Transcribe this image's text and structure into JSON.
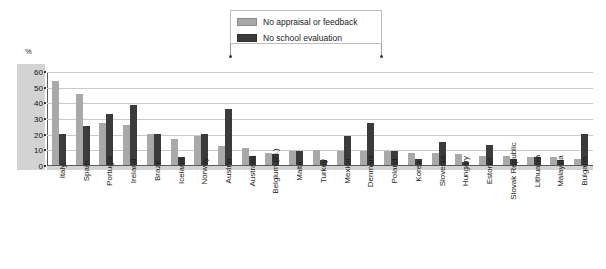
{
  "legend": {
    "items": [
      {
        "label": "No appraisal or feedback",
        "color": "#a9a9a9",
        "swatch_name": "legend-swatch-light"
      },
      {
        "label": "No school evaluation",
        "color": "#3b3b3b",
        "swatch_name": "legend-swatch-dark"
      }
    ]
  },
  "axis": {
    "unit_label": "%",
    "ticks": [
      "60",
      "50",
      "40",
      "30",
      "20",
      "10",
      "0"
    ]
  },
  "chart_data": {
    "type": "bar",
    "title": "",
    "xlabel": "",
    "ylabel": "%",
    "ylim": [
      0,
      60
    ],
    "ytick_step": 10,
    "grid": true,
    "legend_position": "top-center",
    "categories": [
      "Italy",
      "Spain",
      "Portugal",
      "Ireland",
      "Brazil",
      "Iceland",
      "Norway",
      "Austria",
      "Australia",
      "Belgium (Fl.)",
      "Malta",
      "Turkey",
      "Mexico",
      "Denmark",
      "Poland",
      "Korea",
      "Slovenia",
      "Hungary",
      "Estonia",
      "Slovak Republic",
      "Lithuania",
      "Malaysia",
      "Bulgaria"
    ],
    "series": [
      {
        "name": "No appraisal or feedback",
        "color": "#a9a9a9",
        "values": [
          54,
          46,
          27,
          26,
          20,
          17,
          19,
          12,
          11,
          8,
          9,
          10,
          9,
          9,
          9,
          8,
          8,
          7,
          6,
          6,
          5,
          5,
          4
        ]
      },
      {
        "name": "No school evaluation",
        "color": "#3b3b3b",
        "values": [
          20,
          25,
          33,
          39,
          20,
          5,
          20,
          36,
          6,
          7,
          9,
          3,
          19,
          27,
          9,
          4,
          15,
          2,
          13,
          4,
          5,
          3,
          20
        ]
      }
    ]
  }
}
